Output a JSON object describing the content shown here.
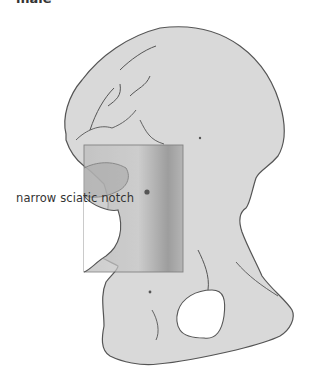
{
  "figure": {
    "header_label": "male",
    "annotation": "narrow sciatic notch",
    "colors": {
      "bone_fill": "#d9d9d9",
      "outline": "#555555",
      "shade": "#7a7a7a",
      "box_stroke": "#666666"
    }
  }
}
